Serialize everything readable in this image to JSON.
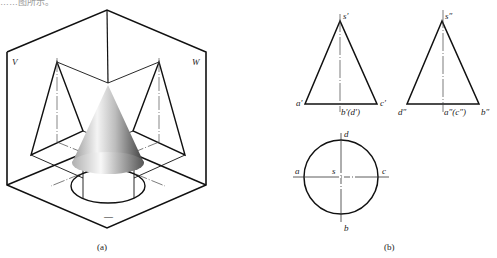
{
  "top_clipped_text": "……图所示。",
  "figure_a": {
    "caption": "(a)",
    "plane_labels": {
      "v": "V",
      "w": "W"
    },
    "box_mark": "—"
  },
  "figure_b": {
    "caption": "(b)",
    "front_view": {
      "apex": "s′",
      "left": "a′",
      "right": "c′",
      "center": "b′(d′)"
    },
    "side_view": {
      "apex": "s″",
      "left": "d″",
      "right": "b″",
      "center": "a″(c″)"
    },
    "top_view": {
      "top": "d",
      "left": "a",
      "center": "s",
      "right": "c",
      "bottom": "b"
    }
  },
  "colors": {
    "line": "#111111",
    "centerline": "#444444",
    "cone_light": "#f2f2f2",
    "cone_dark": "#555555"
  }
}
